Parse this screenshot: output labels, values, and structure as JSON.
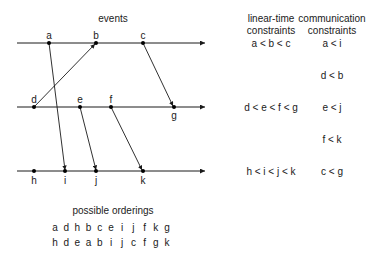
{
  "titles": {
    "events": "events",
    "linear_time": [
      "linear-time",
      "constraints"
    ],
    "communication": [
      "communication",
      "constraints"
    ],
    "orderings": "possible orderings"
  },
  "processes": [
    {
      "y": 43,
      "events": [
        {
          "name": "a",
          "x": 49
        },
        {
          "name": "b",
          "x": 96
        },
        {
          "name": "c",
          "x": 143
        }
      ]
    },
    {
      "y": 107,
      "events": [
        {
          "name": "d",
          "x": 34
        },
        {
          "name": "e",
          "x": 80
        },
        {
          "name": "f",
          "x": 111
        },
        {
          "name": "g",
          "x": 174
        }
      ]
    },
    {
      "y": 171,
      "events": [
        {
          "name": "h",
          "x": 34
        },
        {
          "name": "i",
          "x": 65
        },
        {
          "name": "j",
          "x": 96
        },
        {
          "name": "k",
          "x": 143
        }
      ]
    }
  ],
  "messages": [
    {
      "from": "a",
      "to": "i"
    },
    {
      "from": "d",
      "to": "b"
    },
    {
      "from": "e",
      "to": "j"
    },
    {
      "from": "f",
      "to": "k"
    },
    {
      "from": "c",
      "to": "g"
    }
  ],
  "linear_time_constraints": [
    "a < b < c",
    "d < e < f < g",
    "h < i < j < k"
  ],
  "communication_constraints": [
    "a < i",
    "d < b",
    "e < j",
    "f < k",
    "c < g"
  ],
  "possible_orderings": [
    [
      "a",
      "d",
      "h",
      "b",
      "c",
      "e",
      "i",
      "j",
      "f",
      "k",
      "g"
    ],
    [
      "h",
      "d",
      "e",
      "a",
      "b",
      "i",
      "j",
      "c",
      "f",
      "g",
      "k"
    ]
  ],
  "colors": {
    "line": "#1a1a1a",
    "text": "#1a1a1a"
  }
}
